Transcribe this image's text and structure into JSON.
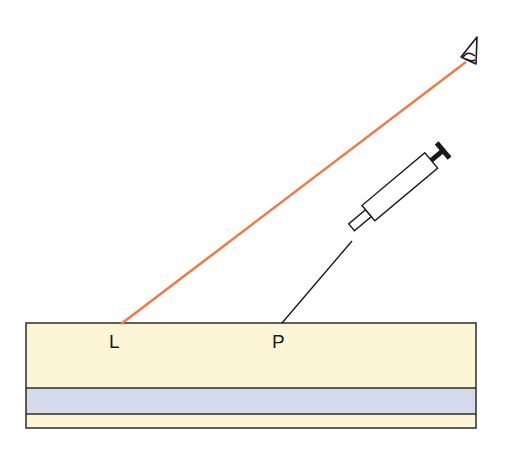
{
  "diagram": {
    "type": "tissue-layer-schematic",
    "labels": {
      "L": "L",
      "P": "P"
    },
    "elements": [
      {
        "id": "eye",
        "description": "observer eye icon at upper right"
      },
      {
        "id": "sight-line",
        "description": "orange line of sight from eye to point L on tissue surface"
      },
      {
        "id": "syringe",
        "description": "syringe with needle inserted toward point P on surface"
      },
      {
        "id": "tissue-layers",
        "description": "layered block: thick upper yellow layer, blue middle band, thin lower yellow layer"
      }
    ],
    "colors": {
      "sight_line": "#ef7a45",
      "upper_layer": "#fdf6d6",
      "middle_band": "#d5dbea",
      "lower_layer": "#fdf6d6",
      "outline": "#2b2b2b"
    }
  }
}
